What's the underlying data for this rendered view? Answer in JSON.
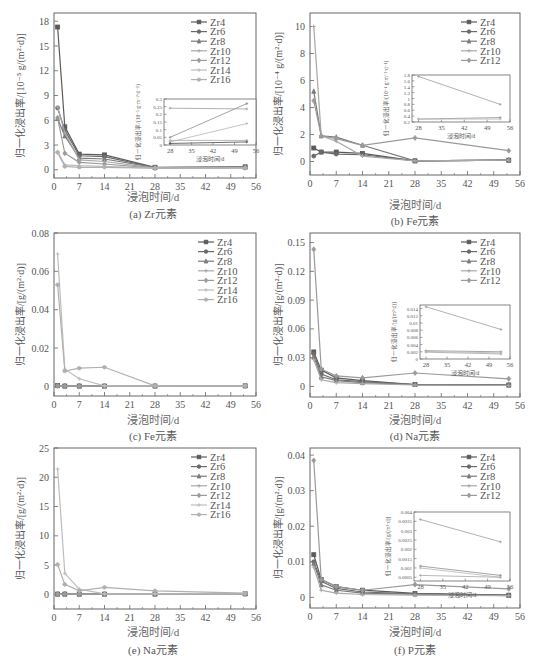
{
  "chart_data": [
    {
      "id": "a",
      "type": "line",
      "caption": "(a) Zr元素",
      "xlabel": "浸泡时间/d",
      "ylabel": "归一化浸出率/[10⁻⁵ g/(m²·d)]",
      "xlim": [
        0,
        56
      ],
      "xticks": [
        0,
        7,
        14,
        21,
        28,
        35,
        42,
        49,
        56
      ],
      "ylim": [
        -1,
        19
      ],
      "yticks": [
        0,
        3,
        6,
        9,
        12,
        15,
        18
      ],
      "legend_position": "upper right",
      "x": [
        1,
        3,
        7,
        14,
        28,
        53
      ],
      "series": [
        {
          "name": "Zr4",
          "values": [
            17.3,
            5.2,
            1.9,
            1.8,
            0.3,
            0.35
          ]
        },
        {
          "name": "Zr6",
          "values": [
            7.5,
            4.8,
            1.7,
            1.6,
            0.25,
            0.3
          ]
        },
        {
          "name": "Zr8",
          "values": [
            6.2,
            4.1,
            1.4,
            1.3,
            0.25,
            0.3
          ]
        },
        {
          "name": "Zr10",
          "values": [
            7.6,
            4.5,
            1.2,
            1.0,
            0.2,
            0.25
          ]
        },
        {
          "name": "Zr12",
          "values": [
            6.3,
            2.0,
            0.9,
            0.7,
            0.2,
            0.25
          ]
        },
        {
          "name": "Zr14",
          "values": [
            2.2,
            0.6,
            0.5,
            0.4,
            0.2,
            0.2
          ]
        },
        {
          "name": "Zr16",
          "values": [
            2.1,
            0.4,
            0.3,
            0.3,
            0.2,
            0.2
          ]
        }
      ],
      "inset": {
        "xlabel": "浸泡时间/d",
        "ylabel": "归一化浸出率/(10⁻⁵ g·m⁻²·d⁻¹)",
        "xlim": [
          26,
          56
        ],
        "xticks": [
          28,
          35,
          42,
          49,
          56
        ],
        "ylim": [
          0,
          0.3
        ],
        "yticks": [
          0,
          0.05,
          0.1,
          0.15,
          0.2,
          0.25,
          0.3
        ],
        "x": [
          28,
          53
        ],
        "series": [
          {
            "name": "s1",
            "values": [
              0.24,
              0.235
            ]
          },
          {
            "name": "s2",
            "values": [
              0.05,
              0.27
            ]
          },
          {
            "name": "s3",
            "values": [
              0.02,
              0.14
            ]
          },
          {
            "name": "s4",
            "values": [
              0.03,
              0.03
            ]
          },
          {
            "name": "s5",
            "values": [
              0.01,
              0.02
            ]
          }
        ]
      }
    },
    {
      "id": "b",
      "type": "line",
      "caption": "(b) Fe元素",
      "xlabel": "浸泡时间/d",
      "ylabel": "归一化浸出率/[10⁻⁴ g/(m²·d)]",
      "xlim": [
        0,
        56
      ],
      "xticks": [
        0,
        7,
        14,
        21,
        28,
        35,
        42,
        49,
        56
      ],
      "ylim": [
        -1,
        11
      ],
      "yticks": [
        0,
        2,
        4,
        6,
        8,
        10
      ],
      "legend_position": "upper right",
      "x": [
        1,
        3,
        7,
        14,
        28,
        53
      ],
      "series": [
        {
          "name": "Zr4",
          "values": [
            1.0,
            0.7,
            0.7,
            0.6,
            0.05,
            0.1
          ]
        },
        {
          "name": "Zr6",
          "values": [
            0.4,
            0.7,
            0.55,
            0.5,
            0.05,
            0.1
          ]
        },
        {
          "name": "Zr8",
          "values": [
            5.2,
            1.9,
            1.8,
            1.2,
            0.05,
            0.1
          ]
        },
        {
          "name": "Zr10",
          "values": [
            10.0,
            1.9,
            1.5,
            0.4,
            0.05,
            0.1
          ]
        },
        {
          "name": "Zr12",
          "values": [
            4.5,
            1.9,
            1.7,
            1.2,
            1.75,
            0.8
          ]
        }
      ],
      "inset": {
        "xlabel": "浸泡时间/d",
        "ylabel": "归一化浸出率/(10⁻⁴ g·m⁻²·d⁻¹)",
        "xlim": [
          26,
          56
        ],
        "xticks": [
          28,
          35,
          42,
          49,
          56
        ],
        "ylim": [
          0.2,
          1.8
        ],
        "yticks": [
          0.2,
          0.4,
          0.6,
          0.8,
          1.0,
          1.2,
          1.4,
          1.6,
          1.8
        ],
        "x": [
          28,
          53
        ],
        "series": [
          {
            "name": "s1",
            "values": [
              1.75,
              0.8
            ]
          },
          {
            "name": "s2",
            "values": [
              0.3,
              0.35
            ]
          },
          {
            "name": "s3",
            "values": [
              0.3,
              0.3
            ]
          }
        ]
      }
    },
    {
      "id": "c",
      "type": "line",
      "caption": "(c) Fe元素",
      "xlabel": "浸泡时间/d",
      "ylabel": "归一化浸出率/[g/(m²·d)]",
      "xlim": [
        0,
        56
      ],
      "xticks": [
        0,
        7,
        14,
        21,
        28,
        35,
        42,
        49,
        56
      ],
      "ylim": [
        -0.005,
        0.08
      ],
      "yticks": [
        0,
        0.02,
        0.04,
        0.06,
        0.08
      ],
      "legend_position": "upper right",
      "x": [
        1,
        3,
        7,
        14,
        28,
        53
      ],
      "series": [
        {
          "name": "Zr4",
          "values": [
            0.0005,
            0.0002,
            0.0002,
            0.0002,
            0.0002,
            0.0003
          ]
        },
        {
          "name": "Zr6",
          "values": [
            0.0003,
            0.0002,
            0.0002,
            0.0002,
            0.0002,
            0.0003
          ]
        },
        {
          "name": "Zr8",
          "values": [
            0.0004,
            0.0002,
            0.0002,
            0.0002,
            0.0002,
            0.0003
          ]
        },
        {
          "name": "Zr10",
          "values": [
            0.0003,
            0.0002,
            0.0002,
            0.0002,
            0.0002,
            0.0003
          ]
        },
        {
          "name": "Zr12",
          "values": [
            0.0003,
            0.0002,
            0.0002,
            0.0002,
            0.0002,
            0.0003
          ]
        },
        {
          "name": "Zr14",
          "values": [
            0.069,
            0.009,
            0.004,
            0.0003,
            0.0003,
            0.0003
          ]
        },
        {
          "name": "Zr16",
          "values": [
            0.053,
            0.008,
            0.0095,
            0.01,
            0.0003,
            0.0003
          ]
        }
      ]
    },
    {
      "id": "d",
      "type": "line",
      "caption": "(d) Na元素",
      "xlabel": "浸泡时间/d",
      "ylabel": "归一化浸出率/[g/(m²·d)]",
      "xlim": [
        0,
        56
      ],
      "xticks": [
        0,
        7,
        14,
        21,
        28,
        35,
        42,
        49,
        56
      ],
      "ylim": [
        -0.011,
        0.16
      ],
      "yticks": [
        0,
        0.03,
        0.06,
        0.09,
        0.12,
        0.15
      ],
      "legend_position": "upper right",
      "x": [
        1,
        3,
        7,
        14,
        28,
        53
      ],
      "series": [
        {
          "name": "Zr4",
          "values": [
            0.036,
            0.017,
            0.009,
            0.006,
            0.002,
            0.0015
          ]
        },
        {
          "name": "Zr6",
          "values": [
            0.034,
            0.013,
            0.007,
            0.005,
            0.002,
            0.0015
          ]
        },
        {
          "name": "Zr8",
          "values": [
            0.031,
            0.01,
            0.006,
            0.004,
            0.002,
            0.0015
          ]
        },
        {
          "name": "Zr10",
          "values": [
            0.028,
            0.007,
            0.004,
            0.003,
            0.0015,
            0.001
          ]
        },
        {
          "name": "Zr12",
          "values": [
            0.143,
            0.018,
            0.011,
            0.009,
            0.014,
            0.008
          ]
        }
      ],
      "inset": {
        "xlabel": "浸泡时间/d",
        "ylabel": "归一化浸出率/[g/(m²·d)]",
        "xlim": [
          26,
          56
        ],
        "xticks": [
          28,
          35,
          42,
          49,
          56
        ],
        "ylim": [
          0,
          0.015
        ],
        "yticks": [
          0,
          0.002,
          0.004,
          0.006,
          0.008,
          0.01,
          0.012,
          0.014
        ],
        "x": [
          28,
          53
        ],
        "series": [
          {
            "name": "s1",
            "values": [
              0.0145,
              0.0082
            ]
          },
          {
            "name": "s2",
            "values": [
              0.0023,
              0.002
            ]
          },
          {
            "name": "s3",
            "values": [
              0.0021,
              0.0017
            ]
          },
          {
            "name": "s4",
            "values": [
              0.0019,
              0.0014
            ]
          }
        ]
      }
    },
    {
      "id": "e",
      "type": "line",
      "caption": "(e) Na元素",
      "xlabel": "浸泡时间/d",
      "ylabel": "归一化浸出率/[g/(m²·d)]",
      "xlim": [
        0,
        56
      ],
      "xticks": [
        0,
        7,
        14,
        21,
        28,
        35,
        42,
        49,
        56
      ],
      "ylim": [
        -2.5,
        25
      ],
      "yticks": [
        0,
        5,
        10,
        15,
        20,
        25
      ],
      "legend_position": "upper right",
      "x": [
        1,
        3,
        7,
        14,
        28,
        53
      ],
      "series": [
        {
          "name": "Zr4",
          "values": [
            0.05,
            0.05,
            0.05,
            0.05,
            0.05,
            0.1
          ]
        },
        {
          "name": "Zr6",
          "values": [
            0.05,
            0.05,
            0.05,
            0.05,
            0.05,
            0.1
          ]
        },
        {
          "name": "Zr8",
          "values": [
            0.05,
            0.05,
            0.05,
            0.05,
            0.05,
            0.1
          ]
        },
        {
          "name": "Zr10",
          "values": [
            0.05,
            0.05,
            0.05,
            0.05,
            0.05,
            0.1
          ]
        },
        {
          "name": "Zr12",
          "values": [
            0.05,
            0.05,
            0.05,
            0.05,
            0.05,
            0.1
          ]
        },
        {
          "name": "Zr14",
          "values": [
            21.4,
            3.6,
            0.9,
            0.1,
            0.1,
            0.1
          ]
        },
        {
          "name": "Zr16",
          "values": [
            5.1,
            1.7,
            0.6,
            1.2,
            0.6,
            0.2
          ]
        }
      ]
    },
    {
      "id": "f",
      "type": "line",
      "caption": "(f) P元素",
      "xlabel": "浸泡时间/d",
      "ylabel": "归一化浸出率/[g/(m²·d)]",
      "xlim": [
        0,
        56
      ],
      "xticks": [
        0,
        7,
        14,
        21,
        28,
        35,
        42,
        49,
        56
      ],
      "ylim": [
        -0.003,
        0.042
      ],
      "yticks": [
        0,
        0.01,
        0.02,
        0.03,
        0.04
      ],
      "legend_position": "upper right",
      "x": [
        1,
        3,
        7,
        14,
        28,
        53
      ],
      "series": [
        {
          "name": "Zr4",
          "values": [
            0.012,
            0.005,
            0.003,
            0.002,
            0.0011,
            0.0006
          ]
        },
        {
          "name": "Zr6",
          "values": [
            0.01,
            0.0045,
            0.0025,
            0.0015,
            0.001,
            0.0006
          ]
        },
        {
          "name": "Zr8",
          "values": [
            0.0095,
            0.0035,
            0.002,
            0.0012,
            0.0009,
            0.0005
          ]
        },
        {
          "name": "Zr10",
          "values": [
            0.0085,
            0.002,
            0.0012,
            0.0008,
            0.0006,
            0.0005
          ]
        },
        {
          "name": "Zr12",
          "values": [
            0.0385,
            0.005,
            0.003,
            0.002,
            0.0036,
            0.0024
          ]
        }
      ],
      "inset": {
        "xlabel": "浸泡时间/d",
        "ylabel": "归一化浸出率/[g/(m²·d)]",
        "xlim": [
          26,
          56
        ],
        "xticks": [
          28,
          35,
          42,
          49,
          56
        ],
        "ylim": [
          0.0003,
          0.004
        ],
        "yticks": [
          0.0005,
          0.001,
          0.0015,
          0.002,
          0.0025,
          0.003,
          0.0035,
          0.004
        ],
        "x": [
          28,
          53
        ],
        "series": [
          {
            "name": "s1",
            "values": [
              0.0036,
              0.0024
            ]
          },
          {
            "name": "s2",
            "values": [
              0.0011,
              0.0006
            ]
          },
          {
            "name": "s3",
            "values": [
              0.001,
              0.0005
            ]
          },
          {
            "name": "s4",
            "values": [
              0.0006,
              0.0005
            ]
          }
        ]
      }
    }
  ],
  "style": {
    "series_colors": [
      "#5a5a5a",
      "#6a6a6a",
      "#7a7a7a",
      "#a8a8a8",
      "#9a9a9a",
      "#bdbdbd",
      "#b0b0b0"
    ],
    "axis_color": "#666666",
    "markers": [
      "square",
      "circle",
      "triangle",
      "cross",
      "diamond",
      "cross",
      "star"
    ]
  }
}
